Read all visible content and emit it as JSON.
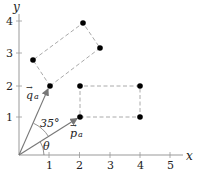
{
  "diagram": {
    "type": "coordinate-geometry",
    "axes": {
      "x_label": "x",
      "y_label": "y",
      "x_ticks": [
        "1",
        "2",
        "3",
        "4",
        "5"
      ],
      "y_ticks": [
        "1",
        "2",
        "3",
        "4"
      ]
    },
    "vectors": [
      {
        "name": "p_a",
        "label": "p",
        "subscript": "a",
        "from": [
          0,
          0
        ],
        "to": [
          2,
          1
        ]
      },
      {
        "name": "q_a",
        "label": "q",
        "subscript": "a",
        "from": [
          0,
          0
        ],
        "to": [
          1,
          2
        ]
      }
    ],
    "angles": [
      {
        "label": "35°",
        "between": [
          "p_a",
          "q_a"
        ]
      },
      {
        "label": "θ",
        "between": [
          "x-axis",
          "p_a"
        ]
      }
    ],
    "rectangles": [
      {
        "name": "axis-aligned-rectangle",
        "vertices": [
          [
            2,
            1
          ],
          [
            4,
            1
          ],
          [
            4,
            2
          ],
          [
            2,
            2
          ]
        ],
        "style": "dashed"
      },
      {
        "name": "rotated-rectangle",
        "vertices": [
          [
            1,
            2
          ],
          [
            0.47,
            2.8
          ],
          [
            2.1,
            3.95
          ],
          [
            2.67,
            3.1
          ]
        ],
        "style": "dashed"
      }
    ],
    "labels": {
      "angle_between": "35°",
      "theta": "θ",
      "p_vec": "p",
      "p_sub": "a",
      "q_vec": "q",
      "q_sub": "a",
      "vec_arrow": "→"
    }
  },
  "colors": {
    "axis": "#888888",
    "vector": "#777777",
    "dashed": "#aaaaaa",
    "point": "#000000",
    "text": "#222222"
  }
}
